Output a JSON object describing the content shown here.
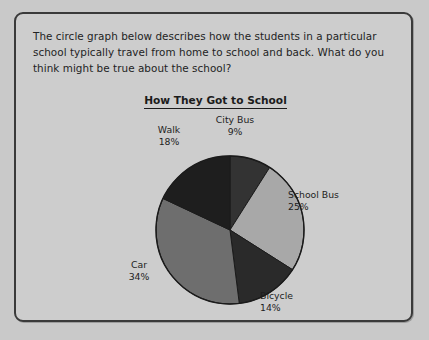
{
  "worksheet": {
    "prompt_line_1": "The circle graph below describes how the students in a particular",
    "prompt_line_2": "school typically travel from home to school and back. What do you",
    "prompt_line_3": "think might be true about the school?"
  },
  "chart_data": {
    "type": "pie",
    "title": "How They Got to School",
    "xlabel": "",
    "ylabel": "",
    "units": "percent",
    "start_angle_deg": 0,
    "direction": "clockwise",
    "legend": "none",
    "grid": false,
    "categories": [
      "City Bus",
      "School Bus",
      "Bicycle",
      "Car",
      "Walk"
    ],
    "values": [
      9,
      25,
      14,
      34,
      18
    ],
    "slices": [
      {
        "label": "City Bus",
        "percent": 9,
        "value_text": "9%",
        "color": "#333333",
        "label_position": "top"
      },
      {
        "label": "School Bus",
        "percent": 25,
        "value_text": "25%",
        "color": "#a8a8a8",
        "label_position": "right"
      },
      {
        "label": "Bicycle",
        "percent": 14,
        "value_text": "14%",
        "color": "#2a2a2a",
        "label_position": "bottom-right"
      },
      {
        "label": "Car",
        "percent": 34,
        "value_text": "34%",
        "color": "#6e6e6e",
        "label_position": "left"
      },
      {
        "label": "Walk",
        "percent": 18,
        "value_text": "18%",
        "color": "#1e1e1e",
        "label_position": "top-left"
      }
    ],
    "geometry": {
      "center_x": 214,
      "center_y": 216,
      "radius": 74
    },
    "colors": {
      "outline": "#1b1b1b",
      "background": "#cdcdcd",
      "text": "#1d1d1d"
    }
  }
}
